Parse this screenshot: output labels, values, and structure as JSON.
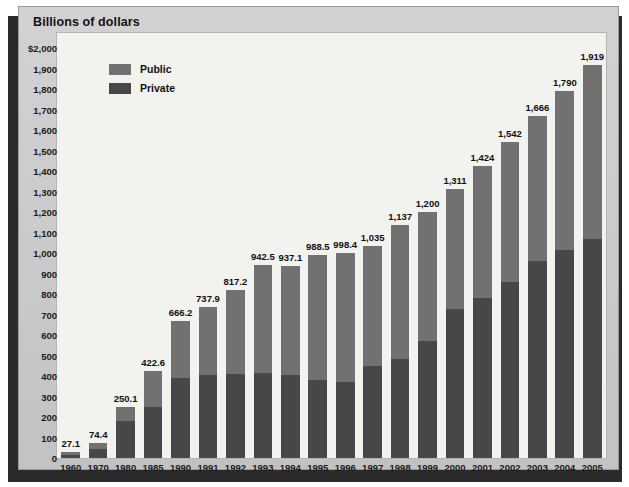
{
  "panel": {
    "title": "Billions of dollars"
  },
  "legend": {
    "items": [
      {
        "label": "Public",
        "color": "#717171",
        "key": "public"
      },
      {
        "label": "Private",
        "color": "#474747",
        "key": "private"
      }
    ]
  },
  "chart_data": {
    "type": "bar",
    "stacked": true,
    "title": "Billions of dollars",
    "xlabel": "",
    "ylabel": "Billions of dollars",
    "ylim": [
      0,
      2000
    ],
    "ytick_step": 100,
    "grid": false,
    "legend_position": "top-left",
    "ytick_labels": [
      "$2,000",
      "1,900",
      "1,800",
      "1,700",
      "1,600",
      "1,500",
      "1,400",
      "1,300",
      "1,200",
      "1,100",
      "1,000",
      "900",
      "800",
      "700",
      "600",
      "500",
      "400",
      "300",
      "200",
      "100",
      "0"
    ],
    "categories": [
      "1960",
      "1970",
      "1980",
      "1985",
      "1990",
      "1991",
      "1992",
      "1993",
      "1994",
      "1995",
      "1996",
      "1997",
      "1998",
      "1999",
      "2000",
      "2001",
      "2002",
      "2003",
      "2004",
      "2005"
    ],
    "totals": [
      27.1,
      74.4,
      250.1,
      422.6,
      666.2,
      737.9,
      817.2,
      942.5,
      937.1,
      988.5,
      998.4,
      1035,
      1137,
      1200,
      1311,
      1424,
      1542,
      1666,
      1790,
      1919
    ],
    "total_labels": [
      "27.1",
      "74.4",
      "250.1",
      "422.6",
      "666.2",
      "737.9",
      "817.2",
      "942.5",
      "937.1",
      "988.5",
      "998.4",
      "1,035",
      "1,137",
      "1,200",
      "1,311",
      "1,424",
      "1,542",
      "1,666",
      "1,790",
      "1,919"
    ],
    "series": [
      {
        "name": "Private",
        "color": "#474747",
        "values": [
          14.0,
          44.0,
          180.0,
          250.0,
          390.0,
          405.0,
          410.0,
          415.0,
          405.0,
          380.0,
          370.0,
          450.0,
          485.0,
          570.0,
          725.0,
          780.0,
          860.0,
          960.0,
          1015.0,
          1070.0
        ]
      },
      {
        "name": "Public",
        "color": "#717171",
        "values": [
          13.1,
          30.4,
          70.1,
          172.6,
          276.2,
          332.9,
          407.2,
          527.5,
          532.1,
          608.5,
          628.4,
          585.0,
          652.0,
          630.0,
          586.0,
          644.0,
          682.0,
          706.0,
          775.0,
          849.0
        ]
      }
    ]
  }
}
